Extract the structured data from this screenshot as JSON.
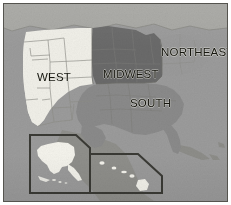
{
  "figure": {
    "kind": "reference-map",
    "width": 231,
    "height": 205,
    "rendering": "grayscale raster / scanned halftone"
  },
  "frame": {
    "border_color": "#55544f",
    "margin_color": "#ffffff"
  },
  "regions": [
    {
      "id": "west",
      "label": "WEST",
      "fill": "#f0efe8",
      "description": "Western states shown in near-white with visible state boundary lines"
    },
    {
      "id": "midwest",
      "label": "MIDWEST",
      "fill": "#6a6a6a",
      "description": "Midwestern states shown in darkest gray"
    },
    {
      "id": "south",
      "label": "SOUTH",
      "fill": "#8a8a8a",
      "description": "Southern states shown in medium gray"
    },
    {
      "id": "northeast",
      "label": "NORTHEAST",
      "fill": "#9a9a9a",
      "description": "Northeastern states shown in light-medium gray"
    }
  ],
  "insets": [
    {
      "id": "alaska",
      "landmass_fill": "#f4f3ec",
      "outline_color": "#3a3a35",
      "corner_style": "angled-top-right"
    },
    {
      "id": "hawaii",
      "landmass_fill": "#f4f3ec",
      "outline_color": "#3a3a35",
      "corner_style": "angled-top-right"
    }
  ],
  "basemap": {
    "background_fill": "#9b9b9b",
    "canada_fill": "#a8a8a4",
    "mexico_fill": "#8f8f8b",
    "ocean_fill": "#9b9b9b",
    "state_line_color": "#7d7d78"
  }
}
